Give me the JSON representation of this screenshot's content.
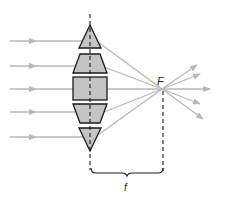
{
  "diagram": {
    "labels": {
      "focal_point": "F",
      "focal_length": "f"
    },
    "colors": {
      "ray": "#b8b8b8",
      "lens_fill": "#c4c4c4",
      "lens_stroke": "#1a1a1a",
      "axis": "#1a1a1a",
      "text": "#222222"
    },
    "lens_segments": [
      "top-prism",
      "upper-trapezoid",
      "center-block",
      "lower-trapezoid",
      "bottom-prism"
    ],
    "incoming_rays_count": 5,
    "outgoing_rays_count": 5
  }
}
